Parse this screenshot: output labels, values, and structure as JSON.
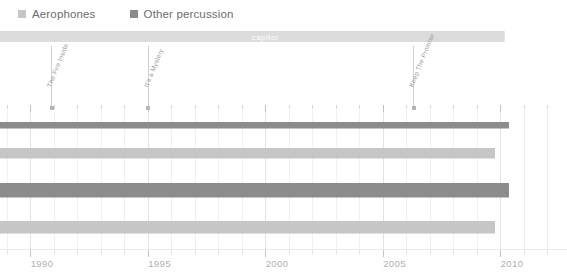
{
  "chart_data": {
    "type": "bar",
    "title": "",
    "subtitle": "",
    "xlabel": "",
    "ylabel": "",
    "orientation": "horizontal",
    "xlim": [
      1988.2,
      2012.6
    ],
    "grid": true,
    "legend_position": "top-left",
    "xticks_major": [
      1990,
      1995,
      2000,
      2005,
      2010
    ],
    "xticks_major_labels": [
      "1990",
      "1995",
      "2000",
      "2005",
      "2010"
    ],
    "xticks_minor": [
      1989,
      1991,
      1992,
      1993,
      1994,
      1996,
      1997,
      1998,
      1999,
      2001,
      2002,
      2003,
      2004,
      2006,
      2007,
      2008,
      2009,
      2011,
      2012
    ],
    "series": [
      {
        "name": "Aerophones",
        "color": "#c6c6c6"
      },
      {
        "name": "Other percussion",
        "color": "#8c8c8c"
      }
    ],
    "categories": [
      "row-1",
      "row-2",
      "row-3",
      "row-4"
    ],
    "bars": [
      {
        "category": "row-1",
        "series": "Other percussion",
        "color": "#8c8c8c",
        "start": 1988.2,
        "end": 2010.4,
        "thickness_px": 7
      },
      {
        "category": "row-2",
        "series": "Aerophones",
        "color": "#c6c6c6",
        "start": 1988.2,
        "end": 2009.8,
        "thickness_px": 11
      },
      {
        "category": "row-3",
        "series": "Other percussion",
        "color": "#8c8c8c",
        "start": 1988.2,
        "end": 2010.4,
        "thickness_px": 15
      },
      {
        "category": "row-4",
        "series": "Aerophones",
        "color": "#c6c6c6",
        "start": 1988.2,
        "end": 2009.8,
        "thickness_px": 13
      }
    ],
    "group_band": {
      "label": "capitol",
      "color": "#dcdcdc",
      "start": 1988.2,
      "end": 2010.2,
      "label_x": 2000.0
    },
    "annotations": [
      {
        "label": "The Fire Inside",
        "x": 1990.9
      },
      {
        "label": "It's a Mystery",
        "x": 1995.0
      },
      {
        "label": "Keep The Promise",
        "x": 2006.3
      }
    ]
  },
  "legend": {
    "entries": [
      {
        "label": "Aerophones",
        "color": "#c6c6c6"
      },
      {
        "label": "Other percussion",
        "color": "#8c8c8c"
      }
    ]
  },
  "band": {
    "label": "capitol"
  },
  "annotations": [
    {
      "label": "The Fire Inside"
    },
    {
      "label": "It's a Mystery"
    },
    {
      "label": "Keep The Promise"
    }
  ],
  "xaxis": {
    "labels": [
      "1990",
      "1995",
      "2000",
      "2005",
      "2010"
    ]
  },
  "colors": {
    "aerophones": "#c6c6c6",
    "other_percussion": "#8c8c8c",
    "band": "#dcdcdc",
    "grid": "#e2e2e2",
    "grid_minor": "#f0f0f0",
    "tick_label": "#b0b0b0",
    "legend_label": "#6c6c6c",
    "annotation_label": "#9a9a9a",
    "background": "#ffffff"
  }
}
